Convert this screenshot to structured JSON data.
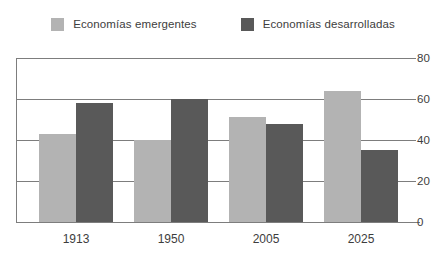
{
  "chart_data": {
    "type": "bar",
    "title": "",
    "subtitle": "",
    "xlabel": "",
    "ylabel": "",
    "categories": [
      "1913",
      "1950",
      "2005",
      "2025"
    ],
    "series": [
      {
        "name": "Economías emergentes",
        "color": "#b3b3b3",
        "values": [
          43,
          40,
          51,
          64
        ]
      },
      {
        "name": "Economías desarrolladas",
        "color": "#595959",
        "values": [
          58,
          60,
          48,
          35
        ]
      }
    ],
    "ylim": [
      0,
      80
    ],
    "yticks": [
      0,
      20,
      40,
      60,
      80
    ],
    "ytick_labels": [
      "0",
      "20",
      "40",
      "60",
      "80"
    ],
    "grid": true,
    "grid_axis": "y",
    "legend_position": "top",
    "y_axis_side": "right",
    "annotations": []
  },
  "legend": {
    "entries": [
      {
        "label": "Economías emergentes",
        "swatch": "legend-swatch-light"
      },
      {
        "label": "Economías desarrolladas",
        "swatch": "legend-swatch-dark"
      }
    ]
  }
}
